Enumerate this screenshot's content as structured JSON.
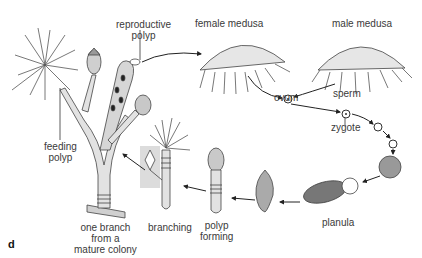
{
  "diagram": {
    "panel_letter": "d",
    "labels": {
      "reproductive_polyp": [
        "reproductive",
        "polyp"
      ],
      "female_medusa": "female medusa",
      "male_medusa": "male medusa",
      "ovum": "ovum",
      "sperm": "sperm",
      "zygote": "zygote",
      "feeding_polyp": [
        "feeding",
        "polyp"
      ],
      "planula": "planula",
      "polyp_forming": [
        "polyp",
        "forming"
      ],
      "branching": "branching",
      "one_branch": [
        "one branch",
        "from a",
        "mature colony"
      ]
    },
    "colors": {
      "line": "#333333",
      "fill": "#d8d8d8",
      "highlight_box": "#d9d9d9"
    }
  }
}
